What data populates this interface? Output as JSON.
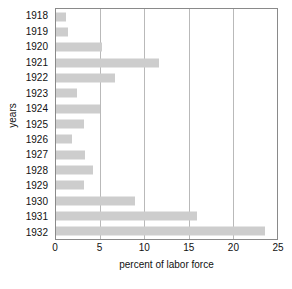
{
  "chart_data": {
    "type": "bar",
    "orientation": "horizontal",
    "title": "",
    "xlabel": "percent of labor force",
    "ylabel": "years",
    "categories": [
      "1918",
      "1919",
      "1920",
      "1921",
      "1922",
      "1923",
      "1924",
      "1925",
      "1926",
      "1927",
      "1928",
      "1929",
      "1930",
      "1931",
      "1932"
    ],
    "values": [
      1.1,
      1.4,
      5.2,
      11.7,
      6.7,
      2.4,
      5.0,
      3.2,
      1.8,
      3.3,
      4.2,
      3.2,
      8.9,
      16.0,
      23.6
    ],
    "xlim": [
      0,
      25
    ],
    "xticks": [
      0,
      5,
      10,
      15,
      20,
      25
    ],
    "xtick_labels": [
      "0",
      "5",
      "10",
      "15",
      "20",
      "25"
    ],
    "grid": "vertical",
    "legend": "none",
    "bar_color": "#cdcdcd",
    "frame_color": "#8a8a8a",
    "gridline_color": "#b9b9b9"
  }
}
